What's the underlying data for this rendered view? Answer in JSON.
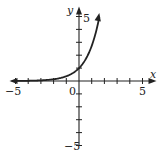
{
  "chart_data": {
    "type": "line",
    "title": "",
    "function": "y = e^x",
    "xlabel": "x",
    "ylabel": "y",
    "xlim": [
      -5,
      5
    ],
    "ylim": [
      -5,
      5
    ],
    "x_ticks": [
      -5,
      -4,
      -3,
      -2,
      -1,
      0,
      1,
      2,
      3,
      4,
      5
    ],
    "y_ticks": [
      -5,
      -4,
      -3,
      -2,
      -1,
      0,
      1,
      2,
      3,
      4,
      5
    ],
    "x_tick_labels": [
      "-5",
      "0",
      "5"
    ],
    "y_tick_labels": [
      "5",
      "-5"
    ],
    "grid": false,
    "legend": null,
    "series": [
      {
        "name": "e^x",
        "x": [
          -5,
          -4,
          -3,
          -2,
          -1,
          -0.5,
          0,
          0.5,
          1,
          1.25,
          1.5,
          1.6
        ],
        "y": [
          0.007,
          0.018,
          0.05,
          0.135,
          0.368,
          0.607,
          1,
          1.649,
          2.718,
          3.49,
          4.48,
          4.95
        ]
      }
    ]
  },
  "labels": {
    "x_axis": "x",
    "y_axis": "y",
    "x_min": "−5",
    "x_zero": "0",
    "x_max": "5",
    "y_max": "5",
    "y_min": "−5"
  },
  "colors": {
    "axis": "#222222",
    "curve": "#222222",
    "background": "#ffffff"
  }
}
